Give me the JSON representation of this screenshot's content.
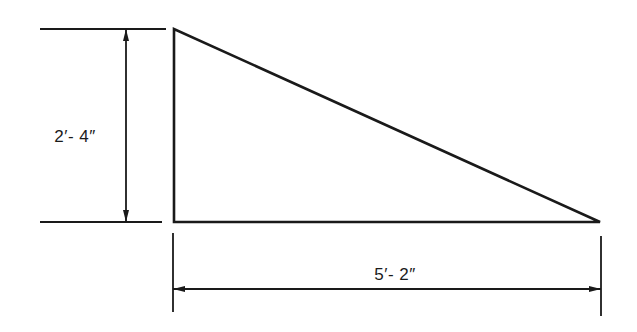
{
  "diagram": {
    "type": "right-triangle-dimension-drawing",
    "line_color": "#1a1a1a",
    "background": "#ffffff",
    "triangle": {
      "vertices": [
        [
          174,
          29
        ],
        [
          174,
          222
        ],
        [
          600,
          222
        ]
      ]
    },
    "dimensions": {
      "height": {
        "label": "2′- 4″",
        "label_pos": [
          75,
          137
        ],
        "ext_lines": [
          [
            40,
            29,
            166,
            29
          ],
          [
            40,
            222,
            162,
            222
          ]
        ],
        "dim_line": [
          126,
          29,
          126,
          222
        ]
      },
      "base": {
        "label": "5′- 2″",
        "label_pos": [
          395,
          275
        ],
        "ext_lines": [
          [
            173,
            233,
            173,
            312
          ],
          [
            601,
            236,
            601,
            316
          ]
        ],
        "dim_line": [
          173,
          289,
          601,
          289
        ]
      }
    }
  }
}
